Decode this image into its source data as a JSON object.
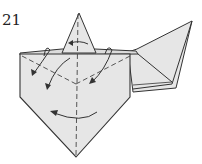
{
  "diagram": {
    "step_number": "21",
    "type": "origami-fold-diagram",
    "colors": {
      "paper": "#e6e6e6",
      "edge": "#333333",
      "fold_line": "#444444",
      "arrow": "#333333",
      "background": "#ffffff"
    },
    "elements": [
      "top-triangle-flap",
      "right-wing-flap",
      "main-pentagon-body",
      "valley-fold-lines",
      "vertical-center-fold-line",
      "fold-arrows",
      "turn-over-arrow"
    ]
  }
}
